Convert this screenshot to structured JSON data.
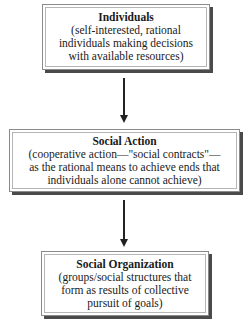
{
  "diagram": {
    "type": "flowchart",
    "direction": "top-to-bottom",
    "nodes": [
      {
        "id": "individuals",
        "title": "Individuals",
        "lines": [
          "(self-interested, rational",
          "individuals making decisions",
          "with available resources)"
        ]
      },
      {
        "id": "social-action",
        "title": "Social Action",
        "lines": [
          "(cooperative action—\"social contracts\"—",
          "as the rational means to achieve ends that",
          "individuals alone cannot achieve)"
        ]
      },
      {
        "id": "social-organization",
        "title": "Social Organization",
        "lines": [
          "(groups/social structures that",
          "form as results of collective",
          "pursuit of goals)"
        ]
      }
    ],
    "edges": [
      {
        "from": "individuals",
        "to": "social-action"
      },
      {
        "from": "social-action",
        "to": "social-organization"
      }
    ],
    "colors": {
      "border": "#8a8a8a",
      "shadow": "#4a4a4a",
      "arrow": "#222222",
      "text": "#1a1a1a"
    }
  }
}
